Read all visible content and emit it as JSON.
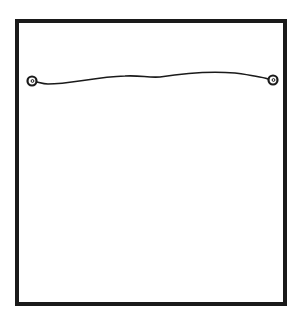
{
  "diagram": {
    "description": "Line drawing of a rectangular frame back with a hanging wire strung between two eyelets near the top",
    "colors": {
      "background": "#ffffff",
      "stroke": "#1a1a1a"
    },
    "frame": {
      "x": 17,
      "y": 21,
      "width": 268,
      "height": 283,
      "stroke_width": 4
    },
    "eyelets": [
      {
        "name": "left-eyelet",
        "cx": 32,
        "cy": 81,
        "r": 4.5
      },
      {
        "name": "right-eyelet",
        "cx": 273,
        "cy": 80,
        "r": 4.5
      }
    ],
    "wire": {
      "path": "M37,82 C41,83 44,84 48,84 C70,84 95,77 125,76 C140,75 148,78 160,77 C185,73 210,71 235,73 C250,75 262,77 268,79",
      "stroke_width": 1.6
    },
    "labels": []
  }
}
